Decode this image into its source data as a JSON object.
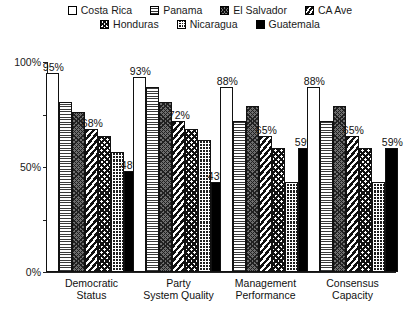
{
  "chart_data": {
    "type": "bar",
    "title": "",
    "xlabel": "",
    "ylabel": "",
    "ylim": [
      0,
      100
    ],
    "y_tick_values": [
      0,
      25,
      50,
      75,
      100
    ],
    "y_tick_labels": [
      "0%",
      "",
      "50%",
      "",
      "100%"
    ],
    "grid": false,
    "legend_position": "top",
    "categories": [
      "Democratic\nStatus",
      "Party\nSystem Quality",
      "Management\nPerformance",
      "Consensus\nCapacity"
    ],
    "category_lines": [
      [
        "Democratic",
        "Status"
      ],
      [
        "Party",
        "System Quality"
      ],
      [
        "Management",
        "Performance"
      ],
      [
        "Consensus",
        "Capacity"
      ]
    ],
    "series": [
      {
        "name": "Costa Rica",
        "pattern": "costarica",
        "values": [
          95,
          93,
          88,
          88
        ],
        "labels": [
          "95%",
          "93%",
          "88%",
          "88%"
        ]
      },
      {
        "name": "Panama",
        "pattern": "panama",
        "values": [
          81,
          88,
          72,
          72
        ],
        "labels": [
          "",
          "",
          "",
          ""
        ]
      },
      {
        "name": "El Salvador",
        "pattern": "elsalvador",
        "values": [
          76,
          81,
          79,
          79
        ],
        "labels": [
          "",
          "",
          "",
          ""
        ]
      },
      {
        "name": "CA Ave",
        "pattern": "caave",
        "values": [
          68,
          72,
          65,
          65
        ],
        "labels": [
          "68%",
          "72%",
          "65%",
          "65%"
        ]
      },
      {
        "name": "Honduras",
        "pattern": "honduras",
        "values": [
          65,
          68,
          59,
          59
        ],
        "labels": [
          "",
          "",
          "",
          ""
        ]
      },
      {
        "name": "Nicaragua",
        "pattern": "nicaragua",
        "values": [
          57,
          63,
          43,
          43
        ],
        "labels": [
          "",
          "",
          "",
          ""
        ]
      },
      {
        "name": "Guatemala",
        "pattern": "guatemala",
        "values": [
          48,
          43,
          59,
          59
        ],
        "labels": [
          "48%",
          "43%",
          "59%",
          "59%"
        ]
      }
    ]
  },
  "legend": {
    "rows": [
      [
        {
          "label": "Costa Rica",
          "pattern": "costarica"
        },
        {
          "label": "Panama",
          "pattern": "panama"
        },
        {
          "label": "El Salvador",
          "pattern": "elsalvador"
        },
        {
          "label": "CA Ave",
          "pattern": "caave"
        }
      ],
      [
        {
          "label": "Honduras",
          "pattern": "honduras"
        },
        {
          "label": "Nicaragua",
          "pattern": "nicaragua"
        },
        {
          "label": "Guatemala",
          "pattern": "guatemala"
        }
      ]
    ]
  },
  "axis": {
    "labels": [
      "100%",
      "50%",
      "0%"
    ]
  },
  "colors": {
    "ink": "#111111",
    "background": "#ffffff",
    "guatemala_fill": "#000000",
    "elsalvador_fill": "#6d6d6d"
  }
}
